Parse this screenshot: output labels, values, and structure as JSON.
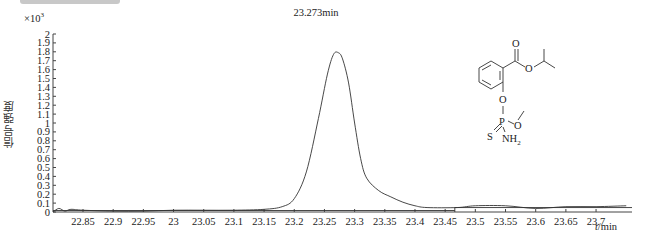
{
  "chart_data": {
    "type": "line",
    "title": "",
    "xlabel": "t/min",
    "ylabel": "信号强度",
    "y_multiplier": "×10³",
    "xlim": [
      22.8,
      23.75
    ],
    "ylim": [
      0,
      2
    ],
    "x_ticks": [
      "22.85",
      "22.9",
      "22.95",
      "23",
      "23.05",
      "23.1",
      "23.15",
      "23.2",
      "23.25",
      "23.3",
      "23.35",
      "23.4",
      "23.45",
      "23.5",
      "23.55",
      "23.6",
      "23.65",
      "23.7"
    ],
    "y_ticks": [
      "0",
      "0.1",
      "0.2",
      "0.3",
      "0.4",
      "0.5",
      "0.6",
      "0.7",
      "0.8",
      "0.9",
      "1",
      "1.1",
      "1.2",
      "1.3",
      "1.4",
      "1.5",
      "1.6",
      "1.7",
      "1.8",
      "1.9",
      "2"
    ],
    "grid": false,
    "annotations": [
      {
        "text": "23.273min",
        "x": 23.273,
        "y": 1.79
      }
    ],
    "series": [
      {
        "name": "chromatogram",
        "x": [
          22.8,
          22.81,
          22.82,
          22.83,
          22.85,
          22.9,
          22.95,
          23.0,
          23.05,
          23.1,
          23.15,
          23.18,
          23.2,
          23.22,
          23.24,
          23.255,
          23.265,
          23.273,
          23.28,
          23.29,
          23.3,
          23.31,
          23.32,
          23.34,
          23.36,
          23.38,
          23.4,
          23.42,
          23.47,
          23.5,
          23.55,
          23.6,
          23.65,
          23.7,
          23.75
        ],
        "values": [
          0.0,
          0.04,
          0.01,
          0.03,
          0.02,
          0.01,
          0.01,
          0.02,
          0.02,
          0.02,
          0.03,
          0.06,
          0.15,
          0.45,
          1.05,
          1.55,
          1.77,
          1.79,
          1.72,
          1.45,
          1.0,
          0.6,
          0.38,
          0.24,
          0.17,
          0.11,
          0.07,
          0.05,
          0.05,
          0.07,
          0.07,
          0.04,
          0.06,
          0.06,
          0.07
        ]
      }
    ]
  },
  "axis": {
    "y_multiplier": "×10",
    "y_exp": "3",
    "x_unit_italic": "t",
    "x_unit_rest": "/min",
    "ylabel": "信号强度"
  },
  "peak_label": "23.273min",
  "molecule": {
    "atoms": {
      "O_carbonyl": "O",
      "O_ester": "O",
      "O_phenoxy": "O",
      "P": "P",
      "O_methoxy": "O",
      "S": "S",
      "N": "NH",
      "N_sub": "2"
    }
  }
}
